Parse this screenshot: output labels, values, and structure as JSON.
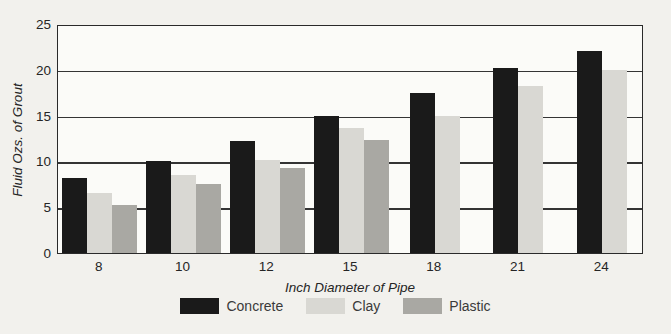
{
  "chart_data": {
    "type": "bar",
    "title": "",
    "xlabel": "Inch Diameter of Pipe",
    "ylabel": "Fluid Ozs. of Grout",
    "categories": [
      "8",
      "10",
      "12",
      "15",
      "18",
      "21",
      "24"
    ],
    "series": [
      {
        "name": "Concrete",
        "color": "#1a1a1a",
        "values": [
          8.2,
          10.0,
          12.2,
          15.0,
          17.5,
          20.2,
          22.0
        ]
      },
      {
        "name": "Clay",
        "color": "#d9d8d3",
        "values": [
          6.5,
          8.5,
          10.2,
          13.6,
          15.0,
          18.2,
          20.0
        ]
      },
      {
        "name": "Plastic",
        "color": "#a9a8a3",
        "values": [
          5.2,
          7.5,
          9.3,
          12.3,
          null,
          null,
          null
        ]
      }
    ],
    "ylim": [
      0,
      25
    ],
    "yticks": [
      0,
      5,
      10,
      15,
      20,
      25
    ],
    "grid": true,
    "legend_position": "bottom",
    "bar_width_px": 25
  },
  "colors": {
    "background": "#f2f1ed",
    "plot_background": "#fbfbf8",
    "axis_line": "#2a2a2a",
    "gridline": "#343434",
    "text": "#252525"
  }
}
